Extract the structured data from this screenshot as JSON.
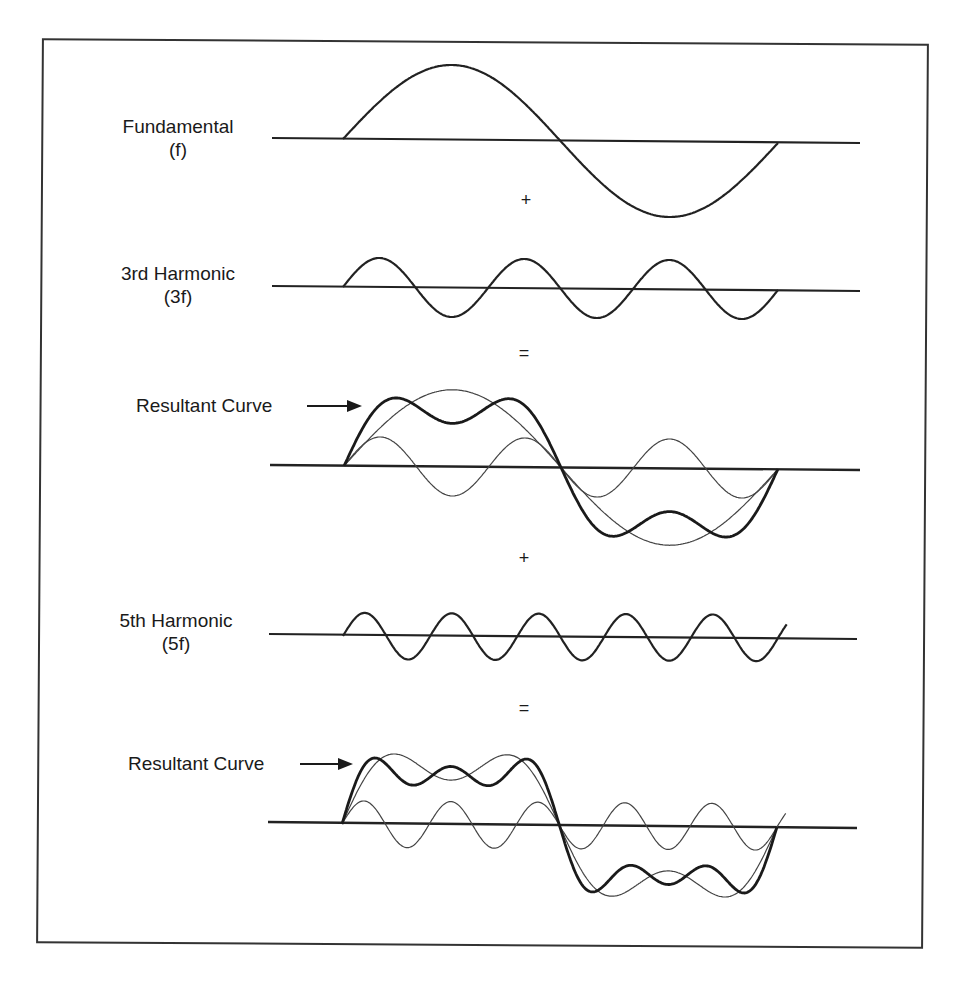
{
  "figure": {
    "colors": {
      "line": "#222222",
      "thin_line": "#444444",
      "frame": "#333333",
      "background": "#ffffff"
    }
  },
  "panels": [
    {
      "id": "fundamental",
      "label_line1": "Fundamental",
      "label_line2": "(f)"
    },
    {
      "id": "third",
      "label_line1": "3rd Harmonic",
      "label_line2": "(3f)"
    },
    {
      "id": "result1",
      "label": "Resultant Curve"
    },
    {
      "id": "fifth",
      "label_line1": "5th Harmonic",
      "label_line2": "(5f)"
    },
    {
      "id": "result2",
      "label": "Resultant Curve"
    }
  ],
  "operators": {
    "plus1": "+",
    "equals1": "=",
    "plus2": "+",
    "equals2": "="
  },
  "chart_data": {
    "type": "line",
    "title": "",
    "x_range": [
      0,
      360
    ],
    "x_unit": "degrees of fundamental period",
    "series": [
      {
        "name": "Fundamental (f)",
        "harmonics": [
          {
            "n": 1,
            "amp": 1.0
          }
        ]
      },
      {
        "name": "3rd Harmonic (3f)",
        "harmonics": [
          {
            "n": 3,
            "amp": 0.38
          }
        ]
      },
      {
        "name": "Resultant Curve (f + 3f)",
        "harmonics": [
          {
            "n": 1,
            "amp": 1.0
          },
          {
            "n": 3,
            "amp": 0.38
          }
        ]
      },
      {
        "name": "5th Harmonic (5f)",
        "harmonics": [
          {
            "n": 5,
            "amp": 0.29
          }
        ]
      },
      {
        "name": "Resultant Curve (f + 3f + 5f)",
        "harmonics": [
          {
            "n": 1,
            "amp": 1.0
          },
          {
            "n": 3,
            "amp": 0.38
          },
          {
            "n": 5,
            "amp": 0.29
          }
        ]
      }
    ],
    "grid": false,
    "legend": "inline labels on left"
  }
}
